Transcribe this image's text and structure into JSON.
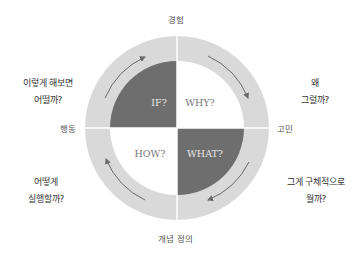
{
  "axes": {
    "top": "경험",
    "bottom": "개념 정의",
    "left": "행동",
    "right": "고민"
  },
  "quadrants": [
    {
      "id": "if",
      "label": "IF?",
      "position": "top-left",
      "fill": "#6e6e6e",
      "text_color": "#e8e8e8"
    },
    {
      "id": "why",
      "label": "WHY?",
      "position": "top-right",
      "fill": "#ffffff",
      "text_color": "#777777"
    },
    {
      "id": "what",
      "label": "WHAT?",
      "position": "bottom-right",
      "fill": "#6e6e6e",
      "text_color": "#e8e8e8"
    },
    {
      "id": "how",
      "label": "HOW?",
      "position": "bottom-left",
      "fill": "#ffffff",
      "text_color": "#777777"
    }
  ],
  "questions": {
    "top_left": {
      "line1": "이렇게 해보면",
      "line2": "어떨까?"
    },
    "top_right": {
      "line1": "왜",
      "line2": "그럴까?"
    },
    "bottom_right": {
      "line1": "그게 구체적으로",
      "line2": "뭘까?"
    },
    "bottom_left": {
      "line1": "어떻게",
      "line2": "실행할까?"
    }
  },
  "colors": {
    "ring": "#d9d9d9",
    "dark_quadrant": "#6e6e6e",
    "arrow": "#6a6a6a",
    "divider": "#ffffff"
  },
  "cycle_direction": "clockwise"
}
